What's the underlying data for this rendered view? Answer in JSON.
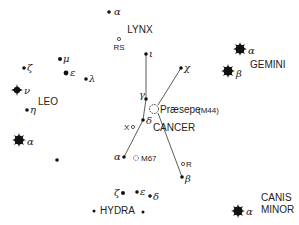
{
  "chart_title": "Star chart of Cancer and surrounding constellations",
  "colors": {
    "ink": "#111111",
    "label": "#222222",
    "background": "#ffffff"
  },
  "constellations": {
    "lynx": "LYNX",
    "leo": "LEO",
    "cancer": "CANCER",
    "gemini": "GEMINI",
    "hydra": "HYDRA",
    "canis_minor_1": "CANIS",
    "canis_minor_2": "MINOR"
  },
  "objects": {
    "praesepe": "Præsepe",
    "praesepe_id": "(M44)",
    "m67": "M67",
    "rs": "RS",
    "x": "X",
    "r": "R"
  },
  "stars": {
    "lynx_alpha": "α",
    "cancer_iota": "ι",
    "cancer_chi": "χ",
    "cancer_gamma": "γ",
    "cancer_delta": "δ",
    "cancer_alpha": "α",
    "cancer_beta": "β",
    "leo_mu": "μ",
    "leo_zeta": "ζ",
    "leo_epsilon": "ε",
    "leo_lambda": "λ",
    "leo_nu": "ν",
    "leo_eta": "η",
    "leo_alpha": "α",
    "gemini_alpha": "α",
    "gemini_beta": "β",
    "hydra_zeta": "ζ",
    "hydra_epsilon": "ε",
    "hydra_delta": "δ",
    "cmi_alpha": "α"
  }
}
